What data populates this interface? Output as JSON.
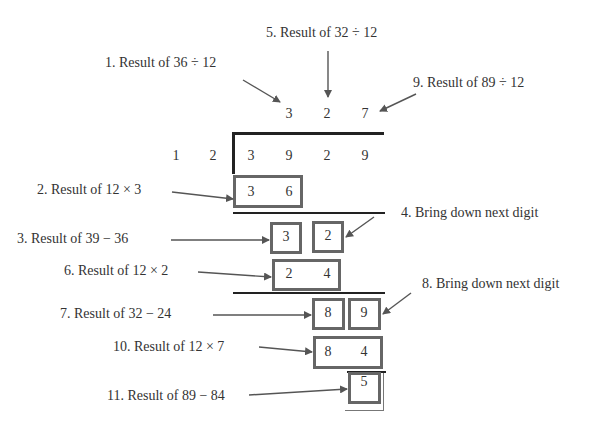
{
  "divisor": [
    "1",
    "2"
  ],
  "dividend": [
    "3",
    "9",
    "2",
    "9"
  ],
  "quotient": [
    "3",
    "2",
    "7"
  ],
  "steps": {
    "s1": "1. Result of 36 ÷ 12",
    "s2": "2. Result of 12 × 3",
    "s3": "3. Result of 39 − 36",
    "s4": "4. Bring down next digit",
    "s5": "5. Result of 32 ÷ 12",
    "s6": "6. Result of 12 × 2",
    "s7": "7. Result of 32 − 24",
    "s8": "8. Bring down next digit",
    "s9": "9. Result of 89 ÷ 12",
    "s10": "10. Result of 12 × 7",
    "s11": "11. Result of 89 − 84"
  },
  "work": {
    "prod1": [
      "3",
      "6"
    ],
    "rem1": "3",
    "down1": "2",
    "prod2": [
      "2",
      "4"
    ],
    "rem2": "8",
    "down2": "9",
    "prod3": [
      "8",
      "4"
    ],
    "final_remainder": "5"
  },
  "colors": {
    "arrow": "#555555",
    "box": "#666666",
    "bar": "#222222"
  }
}
